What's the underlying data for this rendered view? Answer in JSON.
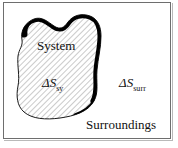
{
  "figure": {
    "background_color": "#ffffff",
    "frame_color": "#6e6e6e",
    "text_color": "#111111",
    "blob": {
      "fill_pattern": "diagonal-hatch",
      "hatch_color": "#9a9a9a",
      "hatch_angle_deg": 45,
      "outline_color": "#000000",
      "outline_style": "variable-width-thick-top-right"
    },
    "labels": {
      "system": "System",
      "delta_s_sys_symbol": "ΔS",
      "delta_s_sys_subscript": "sy",
      "delta_s_surr_symbol": "ΔS",
      "delta_s_surr_subscript": "surr",
      "surroundings": "Surroundings"
    }
  }
}
